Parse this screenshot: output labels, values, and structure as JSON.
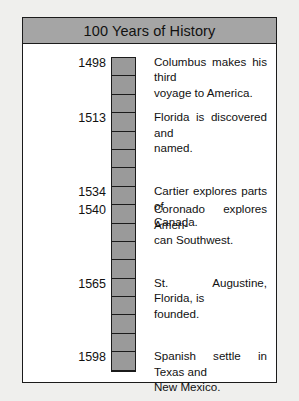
{
  "title": "100 Years of History",
  "timeline": {
    "block_count": 17,
    "block_color": "#9a9a9a",
    "border_color": "#1b1b1b",
    "title_bar_color": "#a5a5a5",
    "background_color": "#ffffff",
    "page_background": "#efefed"
  },
  "events": [
    {
      "year": "1498",
      "block_index": 0,
      "text": "Columbus makes his third voyage to America.",
      "lines": [
        "Columbus makes his third",
        "voyage to America."
      ]
    },
    {
      "year": "1513",
      "block_index": 3,
      "text": "Florida is discovered and named.",
      "lines": [
        "Florida is discovered and",
        "named."
      ]
    },
    {
      "year": "1534",
      "block_index": 7,
      "text": "Cartier explores parts of Canada.",
      "lines": [
        "Cartier explores parts of",
        "Canada."
      ]
    },
    {
      "year": "1540",
      "block_index": 8,
      "text": "Coronado explores American Southwest.",
      "lines": [
        "Coronado explores Ameri-",
        "can Southwest."
      ]
    },
    {
      "year": "1565",
      "block_index": 12,
      "text": "St. Augustine, Florida, is founded.",
      "lines": [
        "St. Augustine, Florida, is",
        "founded."
      ]
    },
    {
      "year": "1598",
      "block_index": 16,
      "text": "Spanish settle in Texas and New Mexico.",
      "lines": [
        "Spanish settle in Texas and",
        "New Mexico."
      ]
    }
  ]
}
